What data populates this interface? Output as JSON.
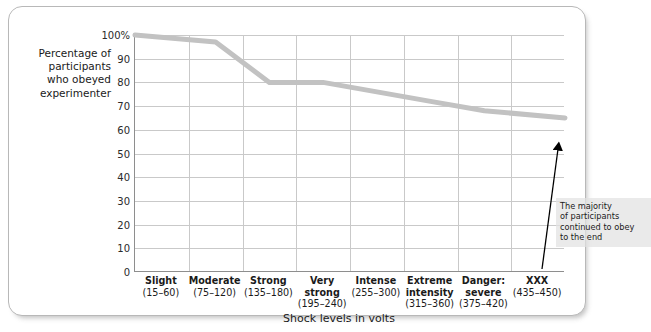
{
  "chart_data": {
    "type": "line",
    "title": "",
    "xlabel": "Shock levels in volts",
    "ylabel": "Percentage of\nparticipants\nwho obeyed\nexperimenter",
    "categories": [
      "Slight\n(15–60)",
      "Moderate\n(75–120)",
      "Strong\n(135–180)",
      "Very\nstrong\n(195–240)",
      "Intense\n(255–300)",
      "Extreme\nintensity\n(315–360)",
      "Danger:\nsevere\n(375–420)",
      "XXX\n(435–450)"
    ],
    "category_names": [
      "Slight",
      "Moderate",
      "Strong",
      "Very strong",
      "Intense",
      "Extreme intensity",
      "Danger: severe",
      "XXX"
    ],
    "category_ranges": [
      "(15–60)",
      "(75–120)",
      "(135–180)",
      "(195–240)",
      "(255–300)",
      "(315–360)",
      "(375–420)",
      "(435–450)"
    ],
    "values": [
      100,
      97,
      80,
      80,
      76,
      72,
      68,
      65
    ],
    "ylim": [
      0,
      100
    ],
    "ytick_labels": [
      "100%",
      "90",
      "80",
      "70",
      "60",
      "50",
      "40",
      "30",
      "20",
      "10",
      "0"
    ],
    "ytick_values": [
      100,
      90,
      80,
      70,
      60,
      50,
      40,
      30,
      20,
      10,
      0
    ],
    "grid": true,
    "legend": "none",
    "series_color": "#c2c2c2",
    "grid_color": "#c9c9c9",
    "axis_color": "#8e8e8e",
    "annotations": [
      {
        "text": "The majority\nof participants\ncontinued to obey\nto the end",
        "pointer": "arrow-up"
      }
    ]
  },
  "annotation": {
    "text": "The majority\nof participants\ncontinued to obey\nto the end"
  }
}
